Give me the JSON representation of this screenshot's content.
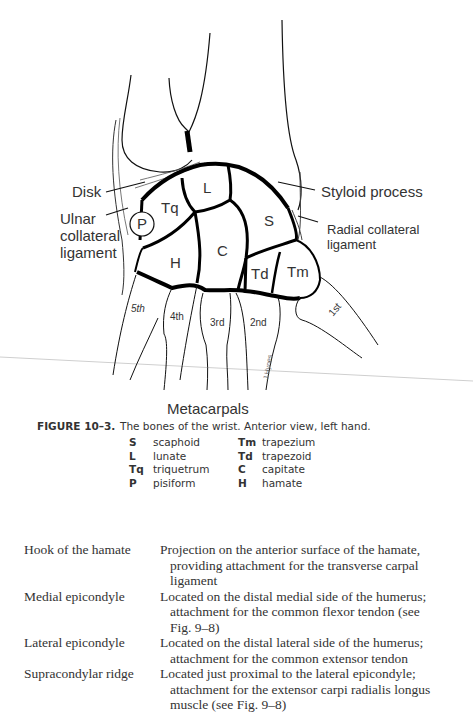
{
  "figure": {
    "labels": {
      "disk": "Disk",
      "ulnar_collateral_ligament": [
        "Ulnar",
        "collateral",
        "ligament"
      ],
      "styloid_process": "Styloid process",
      "radial_collateral_ligament": [
        "Radial collateral",
        "ligament"
      ]
    },
    "bones": {
      "L": "L",
      "Tq": "Tq",
      "P": "P",
      "S": "S",
      "H": "H",
      "C": "C",
      "Td": "Td",
      "Tm": "Tm"
    },
    "metacarpal_labels": [
      "5th",
      "4th",
      "3rd",
      "2nd",
      "1st"
    ],
    "metacarpals_title": "Metacarpals"
  },
  "caption": {
    "figure_number": "FIGURE 10–3.",
    "text": "The bones of the wrist. Anterior view, left hand."
  },
  "legend": [
    {
      "abbr": "S",
      "name": "scaphoid",
      "abbr2": "Tm",
      "name2": "trapezium"
    },
    {
      "abbr": "L",
      "name": "lunate",
      "abbr2": "Td",
      "name2": "trapezoid"
    },
    {
      "abbr": "Tq",
      "name": "triquetrum",
      "abbr2": "C",
      "name2": "capitate"
    },
    {
      "abbr": "P",
      "name": "pisiform",
      "abbr2": "H",
      "name2": "hamate"
    }
  ],
  "definitions": [
    {
      "term": "Hook of the hamate",
      "first": "Projection on the anterior surface of the hamate,",
      "rest": [
        "providing attachment for the transverse carpal",
        "ligament"
      ]
    },
    {
      "term": "Medial epicondyle",
      "first": "Located on the distal medial side of the humerus;",
      "rest": [
        "attachment for the common flexor tendon (see",
        "Fig. 9–8)"
      ]
    },
    {
      "term": "Lateral epicondyle",
      "first": "Located on the distal lateral side of the humerus;",
      "rest": [
        "attachment for the common extensor tendon"
      ]
    },
    {
      "term": "Supracondylar ridge",
      "first": "Located just proximal to the lateral epicondyle;",
      "rest": [
        "attachment for the extensor carpi radialis longus",
        "muscle (see Fig. 9–8)"
      ]
    }
  ]
}
